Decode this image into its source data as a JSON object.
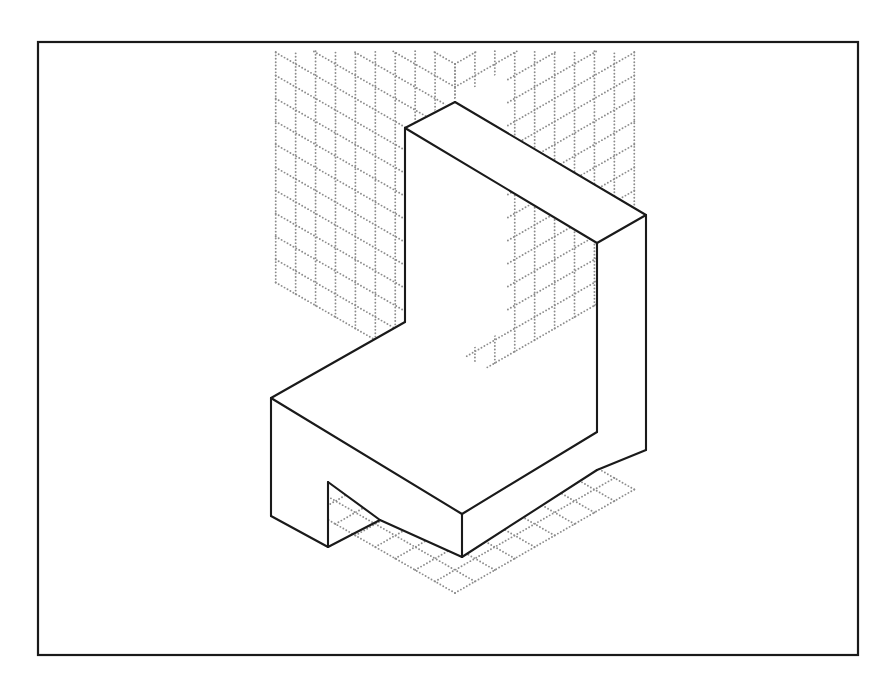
{
  "document": {
    "kind": "isometric-technical-drawing",
    "title": "Isometric pictorial of an L-shaped seat block with front notch",
    "background_color": "#ffffff",
    "ink_color": "#1a1a1a",
    "grid_dot_color": "#8c8c8c"
  },
  "frame": {
    "label": "drawing border",
    "x": 38,
    "y": 42,
    "width": 820,
    "height": 613,
    "stroke_color": "#1a1a1a",
    "stroke_width": 2.2
  },
  "grid": {
    "label": "isometric dotted grid paper",
    "style": "dotted",
    "dot_color": "#8c8c8c",
    "dot_radius": 0.95,
    "planes": [
      {
        "name": "left-vertical-plane",
        "columns": 9,
        "rows": 14
      },
      {
        "name": "right-vertical-plane",
        "columns": 9,
        "rows": 14
      },
      {
        "name": "horizontal-floor-plane",
        "columns": 9,
        "rows": 9
      }
    ],
    "origin": {
      "x": 455,
      "y": 386
    },
    "cell_size": 23,
    "apex": {
      "x": 455,
      "y": 53
    },
    "left_extent_x": 261,
    "right_extent_x": 649,
    "floor_bottom_y": 631
  },
  "object": {
    "name": "l-shaped-seat-block",
    "description": "Chair-like solid: tall vertical back slab joined to a horizontal seat slab, with a rectangular notch cut into the lower front-left face.",
    "stroke_color": "#1a1a1a",
    "stroke_width": 2.1,
    "fill_color": "#ffffff",
    "faces": [
      {
        "name": "back-slab-front-face",
        "points": "405,128 405,387 506,329 506,69"
      },
      {
        "name": "back-slab-top-face",
        "points": "405,128 455,102 646,215 597,243"
      },
      {
        "name": "back-slab-right-face",
        "points": "597,243 646,215 646,450 597,432"
      },
      {
        "name": "seat-top-face",
        "points": "271,398 405,322 597,432 462,514"
      },
      {
        "name": "seat-front-left-face",
        "points": "271,398 271,516 328,547 328,482 380,520 462,557 462,514"
      },
      {
        "name": "seat-front-right-face",
        "points": "462,514 597,432 597,470 462,557"
      }
    ],
    "edges": [
      {
        "name": "back-slab-top-left-edge",
        "from": "405,128",
        "to": "455,102"
      },
      {
        "name": "back-slab-top-ridge-edge",
        "from": "455,102",
        "to": "646,215"
      },
      {
        "name": "back-slab-top-inner-edge",
        "from": "405,128",
        "to": "597,243"
      },
      {
        "name": "back-slab-top-right-edge",
        "from": "597,243",
        "to": "646,215"
      },
      {
        "name": "back-slab-left-vertical-edge",
        "from": "405,128",
        "to": "405,322"
      },
      {
        "name": "back-slab-inner-vertical-edge",
        "from": "597,243",
        "to": "597,432"
      },
      {
        "name": "back-slab-outer-vertical-edge",
        "from": "646,215",
        "to": "646,450"
      },
      {
        "name": "seat-top-left-edge",
        "from": "405,322",
        "to": "271,398"
      },
      {
        "name": "seat-top-front-edge",
        "from": "271,398",
        "to": "462,514"
      },
      {
        "name": "seat-top-right-edge",
        "from": "462,514",
        "to": "597,432"
      },
      {
        "name": "seat-left-vertical-edge",
        "from": "271,398",
        "to": "271,516"
      },
      {
        "name": "seat-front-vertical-edge",
        "from": "462,514",
        "to": "462,557"
      },
      {
        "name": "seat-bottom-left-edge",
        "from": "271,516",
        "to": "328,547"
      },
      {
        "name": "seat-bottom-front-edge",
        "from": "380,520",
        "to": "462,557"
      },
      {
        "name": "seat-bottom-right-edge",
        "from": "462,557",
        "to": "597,470"
      },
      {
        "name": "back-slab-bottom-right-edge",
        "from": "597,470",
        "to": "646,450"
      },
      {
        "name": "notch-vertical-edge",
        "from": "328,482",
        "to": "328,547"
      },
      {
        "name": "notch-diagonal-edge",
        "from": "328,482",
        "to": "380,520"
      },
      {
        "name": "notch-lower-diagonal-edge",
        "from": "328,547",
        "to": "380,520"
      }
    ],
    "notch": {
      "name": "front-face-rectangular-notch",
      "top_left": {
        "x": 328,
        "y": 482
      },
      "bottom_left": {
        "x": 328,
        "y": 547
      },
      "apex_right": {
        "x": 380,
        "y": 520
      }
    }
  }
}
